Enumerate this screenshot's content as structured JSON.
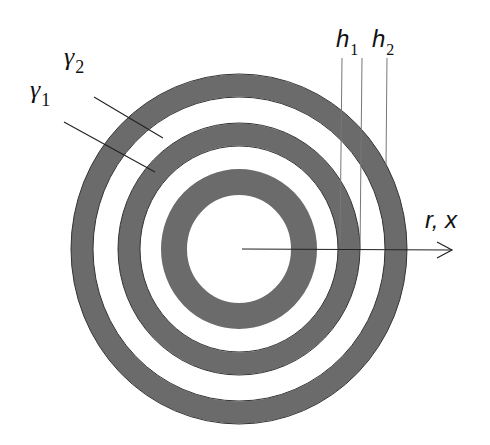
{
  "diagram": {
    "center": {
      "x": 239,
      "y": 249
    },
    "colors": {
      "ring_fill": "#6b6b6b",
      "ring_edge": "#333333",
      "background": "#ffffff",
      "line": "#222222",
      "leader": "#777777"
    },
    "rings": [
      {
        "name": "inner-core-ring",
        "outer_rx": 78,
        "outer_ry": 80,
        "inner_rx": 52,
        "inner_ry": 54
      },
      {
        "name": "middle-ring",
        "outer_rx": 121,
        "outer_ry": 126,
        "inner_rx": 99,
        "inner_ry": 103
      },
      {
        "name": "outer-ring",
        "outer_rx": 168,
        "outer_ry": 175,
        "inner_rx": 146,
        "inner_ry": 152
      }
    ],
    "labels": {
      "gamma1": {
        "base": "γ",
        "sub": "1"
      },
      "gamma2": {
        "base": "γ",
        "sub": "2"
      },
      "h1": {
        "base": "h",
        "sub": "1"
      },
      "h2": {
        "base": "h",
        "sub": "2"
      },
      "axis": "r, x"
    }
  }
}
